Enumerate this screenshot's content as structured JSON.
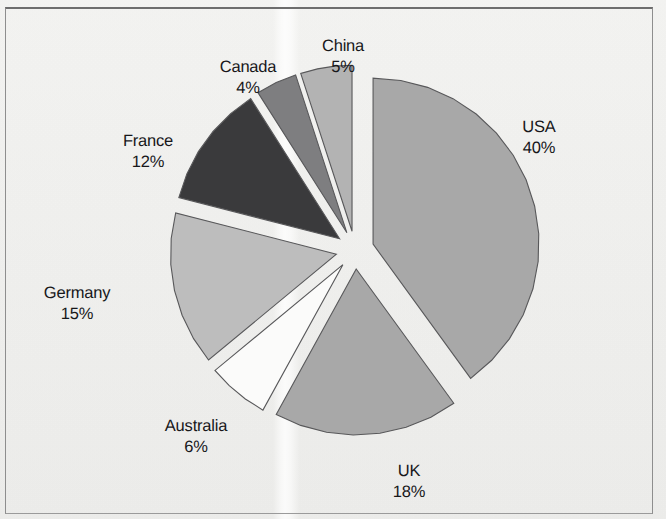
{
  "chart_data": {
    "type": "pie",
    "title": "",
    "subtitle": "",
    "xlabel": "",
    "ylabel": "",
    "legend_position": "none",
    "grid": false,
    "value_unit": "%",
    "total": 100,
    "exploded": true,
    "categories": [
      "USA",
      "UK",
      "Australia",
      "Germany",
      "France",
      "Canada",
      "China"
    ],
    "values": [
      40,
      18,
      6,
      15,
      12,
      4,
      5
    ],
    "slices": [
      {
        "label": "USA",
        "percent_text": "40%",
        "value": 40,
        "color": "#a8a8a8",
        "outline": "#58585a",
        "start_angle": 0,
        "end_angle": 144,
        "label_x": 539,
        "label_y": 138
      },
      {
        "label": "UK",
        "percent_text": "18%",
        "value": 18,
        "color": "#a8a8a8",
        "outline": "#58585a",
        "start_angle": 144,
        "end_angle": 208.8,
        "label_x": 409,
        "label_y": 482
      },
      {
        "label": "Australia",
        "percent_text": "6%",
        "value": 6,
        "color": "#fbfbfa",
        "outline": "#6e6e70",
        "start_angle": 208.8,
        "end_angle": 230.4,
        "label_x": 196,
        "label_y": 437
      },
      {
        "label": "Germany",
        "percent_text": "15%",
        "value": 15,
        "color": "#bdbdbd",
        "outline": "#58585a",
        "start_angle": 230.4,
        "end_angle": 284.4,
        "label_x": 77,
        "label_y": 304
      },
      {
        "label": "France",
        "percent_text": "12%",
        "value": 12,
        "color": "#3a3a3c",
        "outline": "#2a2a2c",
        "start_angle": 284.4,
        "end_angle": 327.6,
        "label_x": 148,
        "label_y": 152
      },
      {
        "label": "Canada",
        "percent_text": "4%",
        "value": 4,
        "color": "#7e7e80",
        "outline": "#555557",
        "start_angle": 327.6,
        "end_angle": 342,
        "label_x": 248,
        "label_y": 78
      },
      {
        "label": "China",
        "percent_text": "5%",
        "value": 5,
        "color": "#b3b3b3",
        "outline": "#58585a",
        "start_angle": 342,
        "end_angle": 360,
        "label_x": 343,
        "label_y": 57
      }
    ],
    "geometry": {
      "center_x": 355,
      "center_y": 250,
      "radius": 166,
      "explode_offset": 19,
      "arc_facets": 9
    },
    "style": {
      "background": "#f3f3f1",
      "frame_color": "#8e8e8e",
      "label_color": "#17171a"
    }
  }
}
